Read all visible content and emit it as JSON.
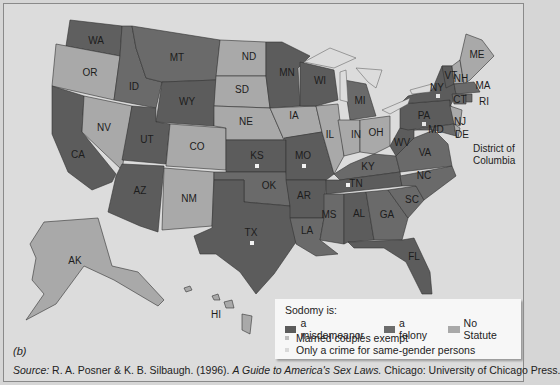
{
  "figure": {
    "panel_label": "(b)",
    "source": {
      "prefix": "Source:",
      "authors": " R. A. Posner & K. B. Silbaugh. (1996). ",
      "title": "A Guide to America's Sex Laws.",
      "publisher": " Chicago: University of Chicago Press."
    }
  },
  "legend": {
    "title": "Sodomy is:",
    "categories": [
      {
        "key": "misdemeanor",
        "label": "a misdemeanor",
        "color": "#5b5b5b"
      },
      {
        "key": "felony",
        "label": "a felony",
        "color": "#6c6c6c"
      },
      {
        "key": "no_statute",
        "label": "No Statute",
        "color": "#a9a9a9"
      }
    ],
    "notes": [
      {
        "key": "married_exempt",
        "label": "Married couples exempt",
        "color": "#bdbdbd"
      },
      {
        "key": "same_gender_only",
        "label": "Only a crime for same-gender persons",
        "color": "#d9d9d9"
      }
    ]
  },
  "colors": {
    "background": "#dcdcdc",
    "felony": "#6a6a6a",
    "misdemeanor": "#585858",
    "no_statute": "#a8a8a8",
    "water": "#dcdcdc"
  },
  "states": [
    {
      "abbr": "WA",
      "x": 92,
      "y": 37
    },
    {
      "abbr": "OR",
      "x": 86,
      "y": 69
    },
    {
      "abbr": "CA",
      "x": 74,
      "y": 151
    },
    {
      "abbr": "NV",
      "x": 100,
      "y": 124
    },
    {
      "abbr": "ID",
      "x": 130,
      "y": 83
    },
    {
      "abbr": "MT",
      "x": 173,
      "y": 54
    },
    {
      "abbr": "WY",
      "x": 183,
      "y": 98
    },
    {
      "abbr": "UT",
      "x": 143,
      "y": 136
    },
    {
      "abbr": "CO",
      "x": 193,
      "y": 143
    },
    {
      "abbr": "AZ",
      "x": 136,
      "y": 187
    },
    {
      "abbr": "NM",
      "x": 185,
      "y": 195
    },
    {
      "abbr": "ND",
      "x": 245,
      "y": 53
    },
    {
      "abbr": "SD",
      "x": 238,
      "y": 86
    },
    {
      "abbr": "NE",
      "x": 242,
      "y": 118
    },
    {
      "abbr": "KS",
      "x": 253,
      "y": 152
    },
    {
      "abbr": "OK",
      "x": 265,
      "y": 182
    },
    {
      "abbr": "TX",
      "x": 247,
      "y": 229
    },
    {
      "abbr": "MN",
      "x": 283,
      "y": 69
    },
    {
      "abbr": "IA",
      "x": 290,
      "y": 112
    },
    {
      "abbr": "MO",
      "x": 299,
      "y": 152
    },
    {
      "abbr": "AR",
      "x": 300,
      "y": 192
    },
    {
      "abbr": "LA",
      "x": 303,
      "y": 227
    },
    {
      "abbr": "WI",
      "x": 316,
      "y": 77
    },
    {
      "abbr": "IL",
      "x": 326,
      "y": 131
    },
    {
      "abbr": "MI",
      "x": 356,
      "y": 97
    },
    {
      "abbr": "IN",
      "x": 352,
      "y": 131
    },
    {
      "abbr": "OH",
      "x": 372,
      "y": 129
    },
    {
      "abbr": "KY",
      "x": 364,
      "y": 163
    },
    {
      "abbr": "TN",
      "x": 352,
      "y": 180
    },
    {
      "abbr": "MS",
      "x": 325,
      "y": 211
    },
    {
      "abbr": "AL",
      "x": 355,
      "y": 210
    },
    {
      "abbr": "GA",
      "x": 383,
      "y": 211
    },
    {
      "abbr": "FL",
      "x": 410,
      "y": 253
    },
    {
      "abbr": "SC",
      "x": 408,
      "y": 196
    },
    {
      "abbr": "NC",
      "x": 420,
      "y": 172
    },
    {
      "abbr": "VA",
      "x": 421,
      "y": 149
    },
    {
      "abbr": "WV",
      "x": 398,
      "y": 139
    },
    {
      "abbr": "PA",
      "x": 420,
      "y": 112
    },
    {
      "abbr": "NY",
      "x": 433,
      "y": 84
    },
    {
      "abbr": "VT",
      "x": 447,
      "y": 72
    },
    {
      "abbr": "NH",
      "x": 457,
      "y": 75
    },
    {
      "abbr": "ME",
      "x": 473,
      "y": 51
    },
    {
      "abbr": "MA",
      "x": 479,
      "y": 82
    },
    {
      "abbr": "RI",
      "x": 480,
      "y": 98
    },
    {
      "abbr": "CT",
      "x": 456,
      "y": 96
    },
    {
      "abbr": "NJ",
      "x": 456,
      "y": 118
    },
    {
      "abbr": "DE",
      "x": 458,
      "y": 131
    },
    {
      "abbr": "MD",
      "x": 432,
      "y": 126
    },
    {
      "abbr": "AK",
      "x": 71,
      "y": 257
    },
    {
      "abbr": "HI",
      "x": 212,
      "y": 311
    }
  ],
  "dc_label": {
    "line1": "District of",
    "line2": "Columbia"
  },
  "markers": [
    {
      "state": "NY",
      "type": "married_exempt",
      "x": 434,
      "y": 92
    },
    {
      "state": "PA",
      "type": "married_exempt",
      "x": 420,
      "y": 120
    },
    {
      "state": "KS",
      "type": "same_gender_only",
      "x": 253,
      "y": 162
    },
    {
      "state": "MO",
      "type": "same_gender_only",
      "x": 300,
      "y": 162
    },
    {
      "state": "TN",
      "type": "same_gender_only",
      "x": 344,
      "y": 181
    },
    {
      "state": "TX",
      "type": "same_gender_only",
      "x": 248,
      "y": 239
    }
  ]
}
